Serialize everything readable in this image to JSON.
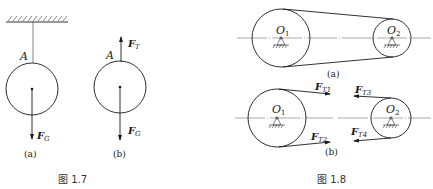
{
  "figure_1_7": {
    "caption": "图 1.7",
    "sub_a": {
      "label": "(a)",
      "point_label": "A",
      "force_gravity": {
        "main": "F",
        "sub": "G"
      }
    },
    "sub_b": {
      "label": "(b)",
      "point_label": "A",
      "force_tension": {
        "main": "F",
        "sub": "T"
      },
      "force_gravity": {
        "main": "F",
        "sub": "G"
      }
    }
  },
  "figure_1_8": {
    "caption": "图 1.8",
    "sub_a": {
      "label": "(a)",
      "pulley_1": {
        "main": "O",
        "sub": "1"
      },
      "pulley_2": {
        "main": "O",
        "sub": "2"
      }
    },
    "sub_b": {
      "label": "(b)",
      "pulley_1": {
        "main": "O",
        "sub": "1"
      },
      "pulley_2": {
        "main": "O",
        "sub": "2"
      },
      "forces": [
        {
          "main": "F",
          "sub": "T1"
        },
        {
          "main": "F",
          "sub": "T2"
        },
        {
          "main": "F",
          "sub": "T3"
        },
        {
          "main": "F",
          "sub": "T4"
        }
      ]
    }
  }
}
